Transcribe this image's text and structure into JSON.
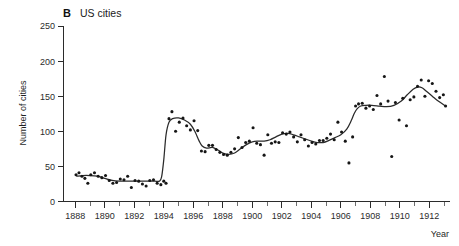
{
  "figure": {
    "panel_letter": "B",
    "panel_title": "US cities",
    "background_color": "#ffffff",
    "ink_color": "#1a1a1a"
  },
  "chart_data": {
    "type": "scatter",
    "title": "US cities",
    "panel_label": "B",
    "xlabel": "Year",
    "ylabel": "Number of cities",
    "xlim": [
      1887.2,
      1913.4
    ],
    "ylim": [
      0,
      250
    ],
    "grid": false,
    "legend": null,
    "x_ticks_major": [
      1888,
      1890,
      1892,
      1894,
      1896,
      1898,
      1900,
      1902,
      1904,
      1906,
      1908,
      1910,
      1912
    ],
    "x_tick_labels": [
      "1888",
      "1890",
      "1892",
      "1894",
      "1896",
      "1898",
      "1900",
      "1902",
      "1904",
      "1906",
      "1908",
      "1910",
      "1912"
    ],
    "x_ticks_minor": [
      1889,
      1891,
      1893,
      1895,
      1897,
      1899,
      1901,
      1903,
      1905,
      1907,
      1909,
      1911,
      1913
    ],
    "y_ticks": [
      0,
      50,
      100,
      150,
      200,
      250
    ],
    "y_tick_labels": [
      "0",
      "50",
      "100",
      "150",
      "200",
      "250"
    ],
    "series": [
      {
        "name": "Number of cities reporting",
        "marker": "filled-circle",
        "marker_color": "#161616",
        "x": [
          1888.05,
          1888.25,
          1888.45,
          1888.65,
          1888.85,
          1889.05,
          1889.3,
          1889.55,
          1889.8,
          1890.05,
          1890.3,
          1890.55,
          1890.8,
          1891.05,
          1891.3,
          1891.55,
          1891.8,
          1892.05,
          1892.3,
          1892.55,
          1892.8,
          1893.05,
          1893.3,
          1893.55,
          1893.8,
          1894.0,
          1894.15,
          1894.35,
          1894.55,
          1894.8,
          1895.05,
          1895.3,
          1895.55,
          1895.8,
          1896.05,
          1896.3,
          1896.55,
          1896.8,
          1897.05,
          1897.3,
          1897.55,
          1897.8,
          1898.05,
          1898.3,
          1898.55,
          1898.8,
          1899.05,
          1899.3,
          1899.55,
          1899.8,
          1900.05,
          1900.3,
          1900.55,
          1900.8,
          1901.05,
          1901.3,
          1901.55,
          1901.8,
          1902.05,
          1902.3,
          1902.55,
          1902.8,
          1903.05,
          1903.3,
          1903.55,
          1903.8,
          1904.05,
          1904.3,
          1904.55,
          1904.8,
          1905.05,
          1905.3,
          1905.55,
          1905.8,
          1906.05,
          1906.3,
          1906.55,
          1906.8,
          1907.0,
          1907.2,
          1907.45,
          1907.7,
          1907.95,
          1908.2,
          1908.45,
          1908.7,
          1908.95,
          1909.2,
          1909.45,
          1909.7,
          1909.95,
          1910.2,
          1910.45,
          1910.7,
          1910.95,
          1911.2,
          1911.45,
          1911.7,
          1911.95,
          1912.2,
          1912.45,
          1912.7,
          1912.95,
          1913.1
        ],
        "y": [
          38,
          41,
          36,
          33,
          26,
          38,
          41,
          36,
          34,
          37,
          30,
          26,
          27,
          32,
          31,
          36,
          20,
          30,
          29,
          25,
          22,
          30,
          31,
          26,
          24,
          29,
          26,
          118,
          128,
          100,
          113,
          119,
          108,
          102,
          115,
          101,
          72,
          71,
          80,
          80,
          74,
          70,
          67,
          66,
          70,
          75,
          91,
          77,
          84,
          86,
          105,
          83,
          81,
          66,
          95,
          83,
          85,
          84,
          98,
          96,
          99,
          92,
          85,
          95,
          88,
          79,
          84,
          82,
          87,
          87,
          90,
          96,
          88,
          113,
          99,
          86,
          55,
          92,
          136,
          139,
          140,
          133,
          136,
          131,
          151,
          139,
          178,
          143,
          64,
          141,
          116,
          147,
          108,
          145,
          149,
          164,
          173,
          150,
          172,
          168,
          157,
          148,
          152,
          136
        ]
      }
    ],
    "trend": {
      "name": "smoothed trend",
      "color": "#2a2a2a",
      "x": [
        1888.1,
        1888.5,
        1889.0,
        1889.5,
        1890.0,
        1890.5,
        1891.0,
        1891.5,
        1892.0,
        1892.5,
        1893.0,
        1893.4,
        1893.7,
        1893.85,
        1894.0,
        1894.15,
        1894.35,
        1894.6,
        1895.0,
        1895.4,
        1895.8,
        1896.1,
        1896.4,
        1896.6,
        1896.9,
        1897.3,
        1897.7,
        1898.0,
        1898.4,
        1898.8,
        1899.2,
        1899.6,
        1900.0,
        1900.4,
        1900.8,
        1901.2,
        1901.6,
        1902.0,
        1902.4,
        1902.8,
        1903.2,
        1903.6,
        1904.0,
        1904.4,
        1904.8,
        1905.2,
        1905.6,
        1906.0,
        1906.4,
        1906.7,
        1906.9,
        1907.1,
        1907.35,
        1907.7,
        1908.1,
        1908.6,
        1909.1,
        1909.6,
        1910.1,
        1910.5,
        1910.9,
        1911.2,
        1911.5,
        1911.8,
        1912.2,
        1912.6,
        1913.1
      ],
      "y": [
        36,
        37,
        37,
        36,
        33,
        30,
        29,
        29,
        29,
        29,
        29,
        29,
        29,
        35,
        60,
        95,
        113,
        118,
        119,
        116,
        110,
        100,
        86,
        79,
        76,
        77,
        73,
        69,
        67,
        69,
        75,
        81,
        85,
        86,
        86,
        88,
        92,
        96,
        97,
        95,
        92,
        89,
        86,
        84,
        84,
        87,
        91,
        95,
        103,
        115,
        125,
        132,
        136,
        137,
        137,
        136,
        135,
        137,
        143,
        152,
        160,
        163,
        162,
        157,
        150,
        143,
        136
      ]
    }
  }
}
